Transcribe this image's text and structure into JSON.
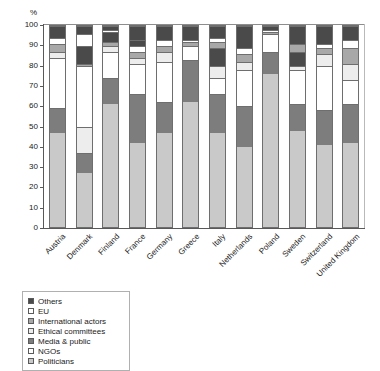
{
  "chart_data": {
    "type": "bar",
    "subtype": "stacked-bar-100-percent",
    "title": "",
    "xlabel": "",
    "ylabel": "%",
    "ylim": [
      0,
      100
    ],
    "yticks": [
      0,
      10,
      20,
      30,
      40,
      50,
      60,
      70,
      80,
      90,
      100
    ],
    "grid": false,
    "legend_position": "below-left",
    "categories": [
      "Austria",
      "Denmark",
      "Finland",
      "France",
      "Germany",
      "Greece",
      "Italy",
      "Netherlands",
      "Poland",
      "Sweden",
      "Switzerland",
      "United Kingdom"
    ],
    "stack_order_bottom_to_top": [
      "Politicians",
      "NGOs",
      "Media & public",
      "Ethical committees",
      "International actors",
      "EU",
      "Others"
    ],
    "series": [
      {
        "name": "Politicians",
        "color": "#c9c9c9",
        "values": [
          47,
          27,
          61,
          42,
          47,
          62,
          47,
          40,
          76,
          48,
          41,
          42
        ]
      },
      {
        "name": "NGOs",
        "color": "#ffffff",
        "values": [
          12,
          10,
          13,
          24,
          15,
          21,
          19,
          20,
          11,
          13,
          17,
          19
        ]
      },
      {
        "name": "Media & public",
        "color": "#7d7d7d",
        "values": [
          25,
          13,
          0,
          0,
          0,
          0,
          0,
          0,
          0,
          0,
          0,
          0
        ]
      },
      {
        "name": "Ethical committees",
        "color": "#ededed",
        "values": [
          3,
          30,
          0,
          15,
          20,
          7,
          8,
          18,
          9,
          13,
          22,
          12
        ]
      },
      {
        "name": "International actors",
        "color": "#a8a8a8",
        "values": [
          4,
          1,
          5,
          3,
          3,
          2,
          6,
          4,
          1,
          5,
          3,
          6
        ]
      },
      {
        "name": "EU",
        "color": "#ffffff",
        "values": [
          3,
          6,
          4,
          3,
          3,
          1,
          4,
          4,
          1,
          5,
          4,
          5
        ]
      },
      {
        "name": "Others",
        "color": "#4a4a4a",
        "values": [
          6,
          13,
          17,
          13,
          12,
          7,
          16,
          14,
          2,
          16,
          13,
          16
        ]
      }
    ],
    "stacks": [
      {
        "category": "Austria",
        "segments": [
          {
            "name": "Politicians",
            "value": 47,
            "fill": "f-politicians"
          },
          {
            "name": "Media & public",
            "value": 12,
            "fill": "f-media"
          },
          {
            "name": "NGOs",
            "value": 25,
            "fill": "f-ngos"
          },
          {
            "name": "Ethical committees",
            "value": 3,
            "fill": "f-ethical"
          },
          {
            "name": "International actors",
            "value": 4,
            "fill": "f-international"
          },
          {
            "name": "EU",
            "value": 3,
            "fill": "f-eu"
          },
          {
            "name": "Others",
            "value": 6,
            "fill": "f-others"
          }
        ]
      },
      {
        "category": "Denmark",
        "segments": [
          {
            "name": "Politicians",
            "value": 27,
            "fill": "f-politicians"
          },
          {
            "name": "Media & public",
            "value": 10,
            "fill": "f-media"
          },
          {
            "name": "Ethical committees",
            "value": 13,
            "fill": "f-ethical"
          },
          {
            "name": "NGOs",
            "value": 30,
            "fill": "f-ngos"
          },
          {
            "name": "International actors",
            "value": 1,
            "fill": "f-international"
          },
          {
            "name": "Others",
            "value": 9,
            "fill": "f-others"
          },
          {
            "name": "EU",
            "value": 6,
            "fill": "f-eu"
          },
          {
            "name": "Others",
            "value": 4,
            "fill": "f-others"
          }
        ]
      },
      {
        "category": "Finland",
        "segments": [
          {
            "name": "Politicians",
            "value": 61,
            "fill": "f-politicians"
          },
          {
            "name": "Media & public",
            "value": 13,
            "fill": "f-media"
          },
          {
            "name": "NGOs",
            "value": 13,
            "fill": "f-ngos"
          },
          {
            "name": "Ethical committees",
            "value": 3,
            "fill": "f-ethical"
          },
          {
            "name": "International actors",
            "value": 2,
            "fill": "f-international"
          },
          {
            "name": "Others",
            "value": 5,
            "fill": "f-others"
          },
          {
            "name": "EU",
            "value": 1,
            "fill": "f-eu"
          },
          {
            "name": "Others",
            "value": 2,
            "fill": "f-others"
          }
        ]
      },
      {
        "category": "France",
        "segments": [
          {
            "name": "Politicians",
            "value": 42,
            "fill": "f-politicians"
          },
          {
            "name": "Media & public",
            "value": 24,
            "fill": "f-media"
          },
          {
            "name": "NGOs",
            "value": 15,
            "fill": "f-ngos"
          },
          {
            "name": "Ethical committees",
            "value": 3,
            "fill": "f-ethical"
          },
          {
            "name": "International actors",
            "value": 3,
            "fill": "f-international"
          },
          {
            "name": "EU",
            "value": 3,
            "fill": "f-eu"
          },
          {
            "name": "Others",
            "value": 3,
            "fill": "f-others"
          },
          {
            "name": "Others",
            "value": 7,
            "fill": "f-others"
          }
        ]
      },
      {
        "category": "Germany",
        "segments": [
          {
            "name": "Politicians",
            "value": 47,
            "fill": "f-politicians"
          },
          {
            "name": "Media & public",
            "value": 15,
            "fill": "f-media"
          },
          {
            "name": "NGOs",
            "value": 20,
            "fill": "f-ngos"
          },
          {
            "name": "Ethical committees",
            "value": 5,
            "fill": "f-ethical"
          },
          {
            "name": "International actors",
            "value": 3,
            "fill": "f-international"
          },
          {
            "name": "EU",
            "value": 3,
            "fill": "f-eu"
          },
          {
            "name": "Others",
            "value": 7,
            "fill": "f-others"
          }
        ]
      },
      {
        "category": "Greece",
        "segments": [
          {
            "name": "Politicians",
            "value": 62,
            "fill": "f-politicians"
          },
          {
            "name": "Media & public",
            "value": 21,
            "fill": "f-media"
          },
          {
            "name": "NGOs",
            "value": 7,
            "fill": "f-ngos"
          },
          {
            "name": "International actors",
            "value": 2,
            "fill": "f-international"
          },
          {
            "name": "EU",
            "value": 1,
            "fill": "f-eu"
          },
          {
            "name": "Others",
            "value": 7,
            "fill": "f-others"
          }
        ]
      },
      {
        "category": "Italy",
        "segments": [
          {
            "name": "Politicians",
            "value": 47,
            "fill": "f-politicians"
          },
          {
            "name": "Media & public",
            "value": 19,
            "fill": "f-media"
          },
          {
            "name": "NGOs",
            "value": 8,
            "fill": "f-ngos"
          },
          {
            "name": "Ethical committees",
            "value": 6,
            "fill": "f-ethical"
          },
          {
            "name": "Others",
            "value": 9,
            "fill": "f-others"
          },
          {
            "name": "International actors",
            "value": 3,
            "fill": "f-international"
          },
          {
            "name": "EU",
            "value": 2,
            "fill": "f-eu"
          },
          {
            "name": "Others",
            "value": 6,
            "fill": "f-others"
          }
        ]
      },
      {
        "category": "Netherlands",
        "segments": [
          {
            "name": "Politicians",
            "value": 40,
            "fill": "f-politicians"
          },
          {
            "name": "Media & public",
            "value": 20,
            "fill": "f-media"
          },
          {
            "name": "NGOs",
            "value": 18,
            "fill": "f-ngos"
          },
          {
            "name": "Ethical committees",
            "value": 4,
            "fill": "f-ethical"
          },
          {
            "name": "International actors",
            "value": 4,
            "fill": "f-international"
          },
          {
            "name": "EU",
            "value": 3,
            "fill": "f-eu"
          },
          {
            "name": "Others",
            "value": 11,
            "fill": "f-others"
          }
        ]
      },
      {
        "category": "Poland",
        "segments": [
          {
            "name": "Politicians",
            "value": 76,
            "fill": "f-politicians"
          },
          {
            "name": "Media & public",
            "value": 11,
            "fill": "f-media"
          },
          {
            "name": "NGOs",
            "value": 9,
            "fill": "f-ngos"
          },
          {
            "name": "International actors",
            "value": 1,
            "fill": "f-international"
          },
          {
            "name": "EU",
            "value": 1,
            "fill": "f-eu"
          },
          {
            "name": "Others",
            "value": 2,
            "fill": "f-others"
          }
        ]
      },
      {
        "category": "Sweden",
        "segments": [
          {
            "name": "Politicians",
            "value": 48,
            "fill": "f-politicians"
          },
          {
            "name": "Media & public",
            "value": 13,
            "fill": "f-media"
          },
          {
            "name": "NGOs",
            "value": 17,
            "fill": "f-ngos"
          },
          {
            "name": "Ethical committees",
            "value": 2,
            "fill": "f-ethical"
          },
          {
            "name": "Others",
            "value": 7,
            "fill": "f-others"
          },
          {
            "name": "International actors",
            "value": 4,
            "fill": "f-international"
          },
          {
            "name": "Others",
            "value": 9,
            "fill": "f-others"
          }
        ]
      },
      {
        "category": "Switzerland",
        "segments": [
          {
            "name": "Politicians",
            "value": 41,
            "fill": "f-politicians"
          },
          {
            "name": "Media & public",
            "value": 17,
            "fill": "f-media"
          },
          {
            "name": "NGOs",
            "value": 22,
            "fill": "f-ngos"
          },
          {
            "name": "Ethical committees",
            "value": 6,
            "fill": "f-ethical"
          },
          {
            "name": "International actors",
            "value": 3,
            "fill": "f-international"
          },
          {
            "name": "EU",
            "value": 2,
            "fill": "f-eu"
          },
          {
            "name": "Others",
            "value": 9,
            "fill": "f-others"
          }
        ]
      },
      {
        "category": "United Kingdom",
        "segments": [
          {
            "name": "Politicians",
            "value": 42,
            "fill": "f-politicians"
          },
          {
            "name": "Media & public",
            "value": 19,
            "fill": "f-media"
          },
          {
            "name": "NGOs",
            "value": 12,
            "fill": "f-ngos"
          },
          {
            "name": "Ethical committees",
            "value": 8,
            "fill": "f-ethical"
          },
          {
            "name": "International actors",
            "value": 8,
            "fill": "f-international"
          },
          {
            "name": "EU",
            "value": 4,
            "fill": "f-eu"
          },
          {
            "name": "Others",
            "value": 7,
            "fill": "f-others"
          }
        ]
      }
    ],
    "legend": [
      {
        "label": "Others",
        "color": "#4a4a4a",
        "fill": "f-others"
      },
      {
        "label": "EU",
        "color": "#ffffff",
        "fill": "f-eu"
      },
      {
        "label": "International actors",
        "color": "#a8a8a8",
        "fill": "f-international"
      },
      {
        "label": "Ethical committees",
        "color": "#ededed",
        "fill": "f-ethical"
      },
      {
        "label": "Media & public",
        "color": "#7d7d7d",
        "fill": "f-media"
      },
      {
        "label": "NGOs",
        "color": "#ffffff",
        "fill": "f-ngos"
      },
      {
        "label": "Politicians",
        "color": "#c9c9c9",
        "fill": "f-politicians"
      }
    ]
  }
}
